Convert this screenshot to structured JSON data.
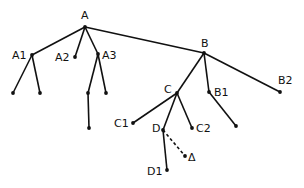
{
  "diagram": {
    "type": "tree",
    "colors": {
      "ink": "#111111",
      "background": "#ffffff"
    },
    "nodes": [
      {
        "id": "A",
        "label": "A",
        "x": 85,
        "y": 27,
        "lx": 81,
        "ly": 19,
        "anchor": "start"
      },
      {
        "id": "A1",
        "label": "A1",
        "x": 32,
        "y": 55,
        "lx": 12,
        "ly": 59,
        "anchor": "start"
      },
      {
        "id": "A2",
        "label": "A2",
        "x": 75,
        "y": 57,
        "lx": 55,
        "ly": 61,
        "anchor": "start"
      },
      {
        "id": "A3",
        "label": "A3",
        "x": 98,
        "y": 54,
        "lx": 102,
        "ly": 59,
        "anchor": "start"
      },
      {
        "id": "A1a",
        "label": "",
        "x": 13,
        "y": 93
      },
      {
        "id": "A1b",
        "label": "",
        "x": 40,
        "y": 93
      },
      {
        "id": "A3a",
        "label": "",
        "x": 88,
        "y": 93
      },
      {
        "id": "A3b",
        "label": "",
        "x": 106,
        "y": 93
      },
      {
        "id": "A3c",
        "label": "",
        "x": 89,
        "y": 128
      },
      {
        "id": "B",
        "label": "B",
        "x": 204,
        "y": 53,
        "lx": 201,
        "ly": 47,
        "anchor": "start"
      },
      {
        "id": "B1",
        "label": "B1",
        "x": 209,
        "y": 92,
        "lx": 214,
        "ly": 96,
        "anchor": "start"
      },
      {
        "id": "B2",
        "label": "B2",
        "x": 280,
        "y": 92,
        "lx": 278,
        "ly": 84,
        "anchor": "start"
      },
      {
        "id": "B1a",
        "label": "",
        "x": 236,
        "y": 126
      },
      {
        "id": "C",
        "label": "C",
        "x": 177,
        "y": 93,
        "lx": 164,
        "ly": 93,
        "anchor": "start"
      },
      {
        "id": "C1",
        "label": "C1",
        "x": 133,
        "y": 123,
        "lx": 114,
        "ly": 127,
        "anchor": "start"
      },
      {
        "id": "C2",
        "label": "C2",
        "x": 192,
        "y": 128,
        "lx": 196,
        "ly": 132,
        "anchor": "start"
      },
      {
        "id": "D",
        "label": "D",
        "x": 163,
        "y": 130,
        "lx": 152,
        "ly": 132,
        "anchor": "start"
      },
      {
        "id": "D1",
        "label": "D1",
        "x": 167,
        "y": 170,
        "lx": 147,
        "ly": 175,
        "anchor": "start"
      },
      {
        "id": "Delta",
        "label": "Δ",
        "x": 185,
        "y": 156,
        "lx": 188,
        "ly": 161,
        "anchor": "start"
      }
    ],
    "edges": [
      {
        "from": "A",
        "to": "A1",
        "style": "solid"
      },
      {
        "from": "A",
        "to": "A2",
        "style": "solid"
      },
      {
        "from": "A",
        "to": "A3",
        "style": "solid"
      },
      {
        "from": "A",
        "to": "B",
        "style": "solid"
      },
      {
        "from": "A1",
        "to": "A1a",
        "style": "solid"
      },
      {
        "from": "A1",
        "to": "A1b",
        "style": "solid"
      },
      {
        "from": "A3",
        "to": "A3a",
        "style": "solid"
      },
      {
        "from": "A3",
        "to": "A3b",
        "style": "solid"
      },
      {
        "from": "A3a",
        "to": "A3c",
        "style": "solid"
      },
      {
        "from": "B",
        "to": "C",
        "style": "solid"
      },
      {
        "from": "B",
        "to": "B1",
        "style": "solid"
      },
      {
        "from": "B",
        "to": "B2",
        "style": "solid"
      },
      {
        "from": "B1",
        "to": "B1a",
        "style": "solid"
      },
      {
        "from": "C",
        "to": "C1",
        "style": "solid"
      },
      {
        "from": "C",
        "to": "D",
        "style": "solid"
      },
      {
        "from": "C",
        "to": "C2",
        "style": "solid"
      },
      {
        "from": "D",
        "to": "D1",
        "style": "solid"
      },
      {
        "from": "D",
        "to": "Delta",
        "style": "dashed"
      }
    ]
  }
}
